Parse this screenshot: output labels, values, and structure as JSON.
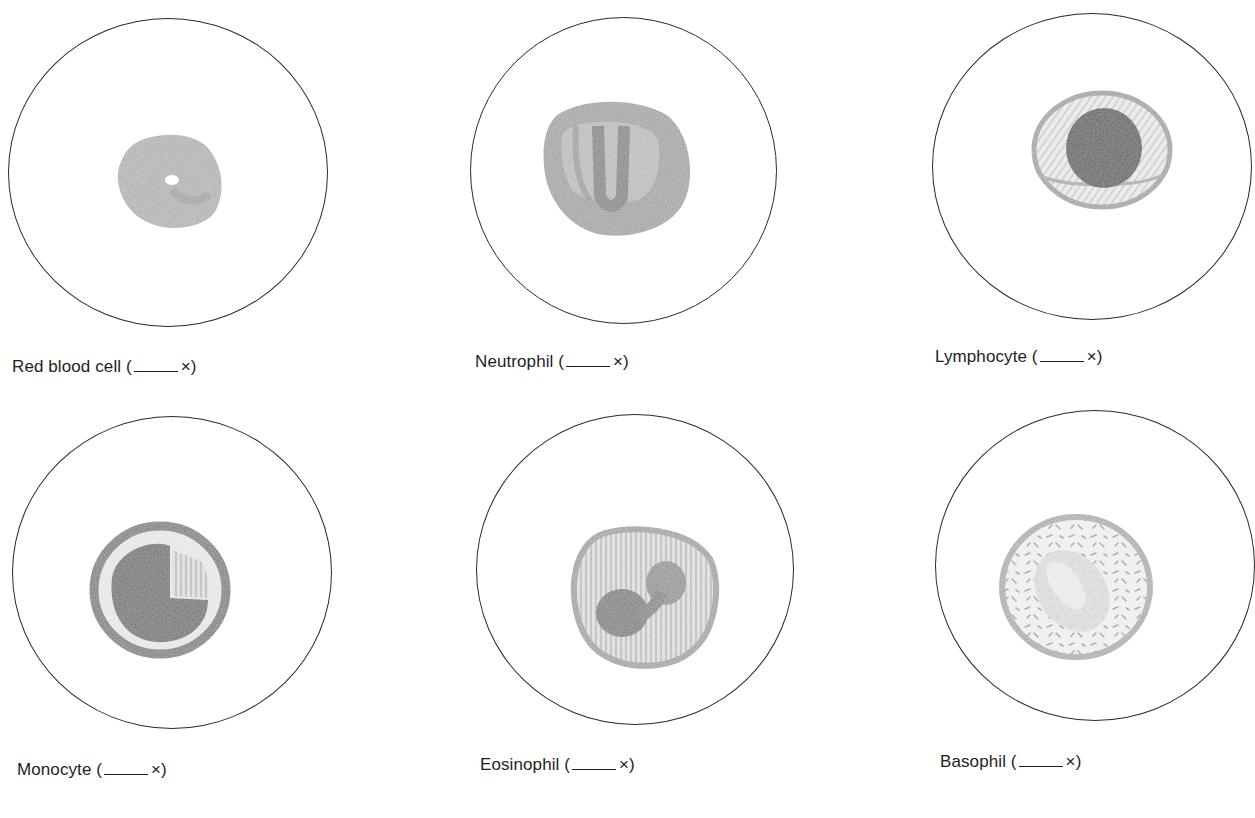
{
  "colors": {
    "background": "#ffffff",
    "field_outline": "#2a2a2a",
    "pencil_light": "#b8b8b8",
    "pencil_mid": "#8f8f8f",
    "pencil_dark": "#5e5e5e",
    "label_text": "#1e1e1e"
  },
  "panels": [
    {
      "id": "red-blood-cell",
      "name": "Red blood cell",
      "magnification_blank": "____",
      "suffix": "×)",
      "prefix": "(",
      "label": "Red blood cell (",
      "field": {
        "cx": 168,
        "cy": 172,
        "r": 160
      }
    },
    {
      "id": "neutrophil",
      "name": "Neutrophil",
      "magnification_blank": "____",
      "suffix": "×)",
      "prefix": "(",
      "label": "Neutrophil (",
      "field": {
        "cx": 623,
        "cy": 170,
        "r": 153
      }
    },
    {
      "id": "lymphocyte",
      "name": "Lymphocyte",
      "magnification_blank": "____",
      "suffix": "×)",
      "prefix": "(",
      "label": "Lymphocyte (",
      "field": {
        "cx": 1093,
        "cy": 167,
        "r": 160
      }
    },
    {
      "id": "monocyte",
      "name": "Monocyte",
      "magnification_blank": "____",
      "suffix": "×)",
      "prefix": "(",
      "label": "Monocyte (",
      "field": {
        "cx": 171,
        "cy": 572,
        "r": 159
      }
    },
    {
      "id": "eosinophil",
      "name": "Eosinophil",
      "magnification_blank": "____",
      "suffix": "×)",
      "prefix": "(",
      "label": "Eosinophil (",
      "field": {
        "cx": 634,
        "cy": 570,
        "r": 158
      }
    },
    {
      "id": "basophil",
      "name": "Basophil",
      "magnification_blank": "____",
      "suffix": "×)",
      "prefix": "(",
      "label": "Basophil (",
      "field": {
        "cx": 1095,
        "cy": 566,
        "r": 160
      }
    }
  ]
}
